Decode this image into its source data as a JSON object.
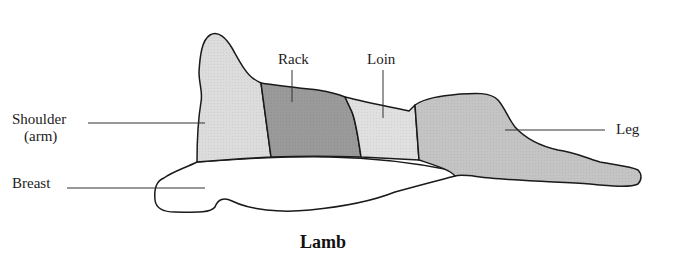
{
  "diagram": {
    "title": "Lamb",
    "cuts": [
      {
        "id": "shoulder",
        "label_line1": "Shoulder",
        "label_line2": "(arm)",
        "color": "#dcdcdc"
      },
      {
        "id": "rack",
        "label": "Rack",
        "color": "#9a9a9a"
      },
      {
        "id": "loin",
        "label": "Loin",
        "color": "#e0e0e0"
      },
      {
        "id": "leg",
        "label": "Leg",
        "color": "#c4c4c4"
      },
      {
        "id": "breast",
        "label": "Breast",
        "color": "#ffffff"
      }
    ],
    "outline_color": "#1a1a1a"
  }
}
